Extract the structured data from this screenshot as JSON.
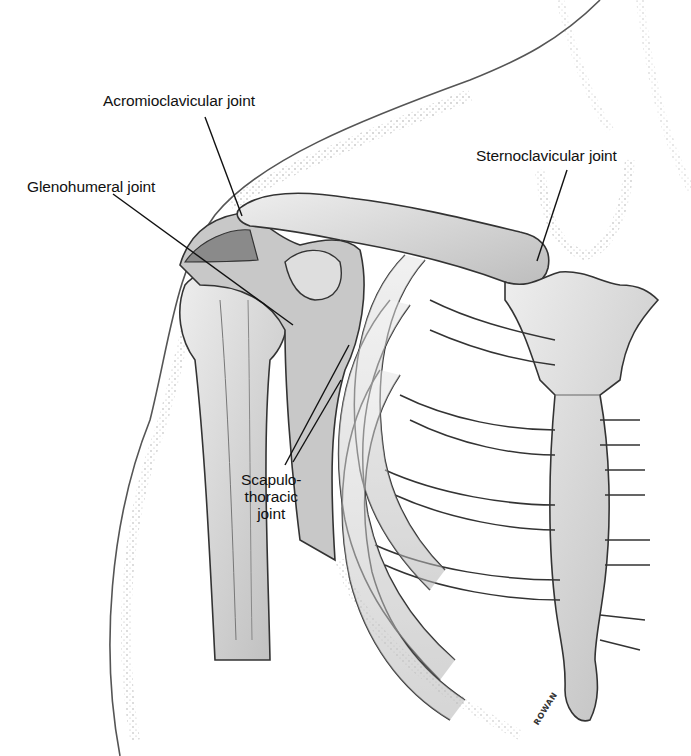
{
  "figure": {
    "labels": [
      {
        "id": "acromioclavicular",
        "text": "Acromioclavicular joint"
      },
      {
        "id": "glenohumeral",
        "text": "Glenohumeral joint"
      },
      {
        "id": "sternoclavicular",
        "text": "Sternoclavicular joint"
      },
      {
        "id": "scapulothoracic",
        "lines": [
          "Scapulo-",
          "thoracic",
          "joint"
        ]
      }
    ],
    "signature": "ROWAN"
  },
  "colors": {
    "background": "#ffffff",
    "ink": "#222222",
    "bone_fill": "#d9d9d9",
    "bone_shade": "#9a9a9a",
    "skin_stipple": "#8a8a8a",
    "leader_line": "#111111"
  }
}
